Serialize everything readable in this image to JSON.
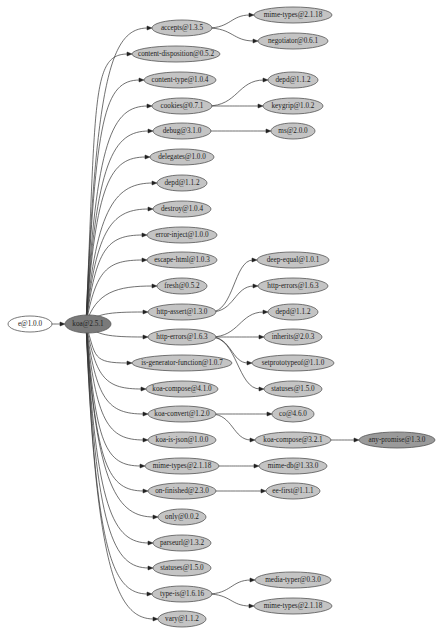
{
  "graph": {
    "title": "Dependency graph",
    "colors": {
      "root_fill": "#ffffff",
      "main_fill": "#7a7a7a",
      "dep_fill": "#c4c4c4",
      "deep_fill": "#9a9a9a",
      "stroke": "#555555",
      "edge": "#333333"
    },
    "nodes": [
      {
        "id": "e",
        "label": "e@1.0.0",
        "x": 30,
        "y": 324,
        "rx": 22,
        "ry": 8,
        "kind": "root"
      },
      {
        "id": "koa",
        "label": "koa@2.5.1",
        "x": 88,
        "y": 324,
        "rx": 23,
        "ry": 9,
        "kind": "main"
      },
      {
        "id": "accepts",
        "label": "accepts@1.3.5",
        "x": 182,
        "y": 28,
        "rx": 30,
        "ry": 8,
        "kind": "dep"
      },
      {
        "id": "content-disposition",
        "label": "content-disposition@0.5.2",
        "x": 176,
        "y": 54,
        "rx": 44,
        "ry": 8,
        "kind": "dep"
      },
      {
        "id": "content-type",
        "label": "content-type@1.0.4",
        "x": 180,
        "y": 80,
        "rx": 36,
        "ry": 8,
        "kind": "dep"
      },
      {
        "id": "cookies",
        "label": "cookies@0.7.1",
        "x": 182,
        "y": 106,
        "rx": 30,
        "ry": 8,
        "kind": "dep"
      },
      {
        "id": "debug",
        "label": "debug@3.1.0",
        "x": 182,
        "y": 131,
        "rx": 29,
        "ry": 8,
        "kind": "dep"
      },
      {
        "id": "delegates",
        "label": "delegates@1.0.0",
        "x": 182,
        "y": 157,
        "rx": 32,
        "ry": 8,
        "kind": "dep"
      },
      {
        "id": "depd",
        "label": "depd@1.1.2",
        "x": 182,
        "y": 183,
        "rx": 25,
        "ry": 8,
        "kind": "dep"
      },
      {
        "id": "destroy",
        "label": "destroy@1.0.4",
        "x": 182,
        "y": 209,
        "rx": 29,
        "ry": 8,
        "kind": "dep"
      },
      {
        "id": "error-inject",
        "label": "error-inject@1.0.0",
        "x": 182,
        "y": 235,
        "rx": 35,
        "ry": 8,
        "kind": "dep"
      },
      {
        "id": "escape-html",
        "label": "escape-html@1.0.3",
        "x": 182,
        "y": 260,
        "rx": 35,
        "ry": 8,
        "kind": "dep"
      },
      {
        "id": "fresh",
        "label": "fresh@0.5.2",
        "x": 182,
        "y": 286,
        "rx": 25,
        "ry": 8,
        "kind": "dep"
      },
      {
        "id": "http-assert",
        "label": "http-assert@1.3.0",
        "x": 182,
        "y": 312,
        "rx": 34,
        "ry": 8,
        "kind": "dep"
      },
      {
        "id": "http-errors",
        "label": "http-errors@1.6.3",
        "x": 182,
        "y": 337,
        "rx": 34,
        "ry": 8,
        "kind": "dep"
      },
      {
        "id": "is-generator-function",
        "label": "is-generator-function@1.0.7",
        "x": 182,
        "y": 363,
        "rx": 50,
        "ry": 8,
        "kind": "dep"
      },
      {
        "id": "koa-compose4",
        "label": "koa-compose@4.1.0",
        "x": 182,
        "y": 389,
        "rx": 36,
        "ry": 8,
        "kind": "dep"
      },
      {
        "id": "koa-convert",
        "label": "koa-convert@1.2.0",
        "x": 182,
        "y": 414,
        "rx": 34,
        "ry": 8,
        "kind": "dep"
      },
      {
        "id": "koa-is-json",
        "label": "koa-is-json@1.0.0",
        "x": 182,
        "y": 440,
        "rx": 34,
        "ry": 8,
        "kind": "dep"
      },
      {
        "id": "mime-types-a",
        "label": "mime-types@2.1.18",
        "x": 182,
        "y": 466,
        "rx": 37,
        "ry": 8,
        "kind": "dep"
      },
      {
        "id": "on-finished",
        "label": "on-finished@2.3.0",
        "x": 182,
        "y": 491,
        "rx": 34,
        "ry": 8,
        "kind": "dep"
      },
      {
        "id": "only",
        "label": "only@0.0.2",
        "x": 182,
        "y": 517,
        "rx": 24,
        "ry": 8,
        "kind": "dep"
      },
      {
        "id": "parseurl",
        "label": "parseurl@1.3.2",
        "x": 182,
        "y": 543,
        "rx": 29,
        "ry": 8,
        "kind": "dep"
      },
      {
        "id": "statuses-a",
        "label": "statuses@1.5.0",
        "x": 182,
        "y": 568,
        "rx": 29,
        "ry": 8,
        "kind": "dep"
      },
      {
        "id": "type-is",
        "label": "type-is@1.6.16",
        "x": 182,
        "y": 594,
        "rx": 30,
        "ry": 8,
        "kind": "dep"
      },
      {
        "id": "vary",
        "label": "vary@1.1.2",
        "x": 182,
        "y": 619,
        "rx": 24,
        "ry": 8,
        "kind": "dep"
      },
      {
        "id": "mime-types-b",
        "label": "mime-types@2.1.18",
        "x": 293,
        "y": 15,
        "rx": 39,
        "ry": 8,
        "kind": "dep"
      },
      {
        "id": "negotiator",
        "label": "negotiator@0.6.1",
        "x": 293,
        "y": 41,
        "rx": 35,
        "ry": 8,
        "kind": "dep"
      },
      {
        "id": "depd-b",
        "label": "depd@1.1.2",
        "x": 293,
        "y": 80,
        "rx": 25,
        "ry": 8,
        "kind": "dep"
      },
      {
        "id": "keygrip",
        "label": "keygrip@1.0.2",
        "x": 293,
        "y": 106,
        "rx": 30,
        "ry": 8,
        "kind": "dep"
      },
      {
        "id": "ms",
        "label": "ms@2.0.0",
        "x": 293,
        "y": 131,
        "rx": 22,
        "ry": 8,
        "kind": "dep"
      },
      {
        "id": "deep-equal",
        "label": "deep-equal@1.0.1",
        "x": 293,
        "y": 260,
        "rx": 36,
        "ry": 8,
        "kind": "dep"
      },
      {
        "id": "http-errors-b",
        "label": "http-errors@1.6.3",
        "x": 293,
        "y": 286,
        "rx": 35,
        "ry": 8,
        "kind": "dep"
      },
      {
        "id": "depd-c",
        "label": "depd@1.1.2",
        "x": 293,
        "y": 312,
        "rx": 25,
        "ry": 8,
        "kind": "dep"
      },
      {
        "id": "inherits",
        "label": "inherits@2.0.3",
        "x": 293,
        "y": 337,
        "rx": 29,
        "ry": 8,
        "kind": "dep"
      },
      {
        "id": "setprototypeof",
        "label": "setprototypeof@1.1.0",
        "x": 293,
        "y": 363,
        "rx": 41,
        "ry": 8,
        "kind": "dep"
      },
      {
        "id": "statuses-b",
        "label": "statuses@1.5.0",
        "x": 293,
        "y": 389,
        "rx": 29,
        "ry": 8,
        "kind": "dep"
      },
      {
        "id": "co",
        "label": "co@4.6.0",
        "x": 293,
        "y": 414,
        "rx": 21,
        "ry": 8,
        "kind": "dep"
      },
      {
        "id": "koa-compose3",
        "label": "koa-compose@3.2.1",
        "x": 293,
        "y": 440,
        "rx": 38,
        "ry": 8,
        "kind": "dep"
      },
      {
        "id": "mime-db",
        "label": "mime-db@1.33.0",
        "x": 293,
        "y": 466,
        "rx": 34,
        "ry": 8,
        "kind": "dep"
      },
      {
        "id": "ee-first",
        "label": "ee-first@1.1.1",
        "x": 293,
        "y": 491,
        "rx": 27,
        "ry": 8,
        "kind": "dep"
      },
      {
        "id": "media-typer",
        "label": "media-typer@0.3.0",
        "x": 293,
        "y": 580,
        "rx": 38,
        "ry": 8,
        "kind": "dep"
      },
      {
        "id": "mime-types-c",
        "label": "mime-types@2.1.18",
        "x": 293,
        "y": 606,
        "rx": 39,
        "ry": 8,
        "kind": "dep"
      },
      {
        "id": "any-promise",
        "label": "any-promise@1.3.0",
        "x": 397,
        "y": 440,
        "rx": 38,
        "ry": 8,
        "kind": "deep"
      }
    ],
    "edges": [
      [
        "e",
        "koa"
      ],
      [
        "koa",
        "accepts"
      ],
      [
        "koa",
        "content-disposition"
      ],
      [
        "koa",
        "content-type"
      ],
      [
        "koa",
        "cookies"
      ],
      [
        "koa",
        "debug"
      ],
      [
        "koa",
        "delegates"
      ],
      [
        "koa",
        "depd"
      ],
      [
        "koa",
        "destroy"
      ],
      [
        "koa",
        "error-inject"
      ],
      [
        "koa",
        "escape-html"
      ],
      [
        "koa",
        "fresh"
      ],
      [
        "koa",
        "http-assert"
      ],
      [
        "koa",
        "http-errors"
      ],
      [
        "koa",
        "is-generator-function"
      ],
      [
        "koa",
        "koa-compose4"
      ],
      [
        "koa",
        "koa-convert"
      ],
      [
        "koa",
        "koa-is-json"
      ],
      [
        "koa",
        "mime-types-a"
      ],
      [
        "koa",
        "on-finished"
      ],
      [
        "koa",
        "only"
      ],
      [
        "koa",
        "parseurl"
      ],
      [
        "koa",
        "statuses-a"
      ],
      [
        "koa",
        "type-is"
      ],
      [
        "koa",
        "vary"
      ],
      [
        "accepts",
        "mime-types-b"
      ],
      [
        "accepts",
        "negotiator"
      ],
      [
        "cookies",
        "depd-b"
      ],
      [
        "cookies",
        "keygrip"
      ],
      [
        "debug",
        "ms"
      ],
      [
        "http-assert",
        "deep-equal"
      ],
      [
        "http-assert",
        "http-errors-b"
      ],
      [
        "http-errors",
        "depd-c"
      ],
      [
        "http-errors",
        "inherits"
      ],
      [
        "http-errors",
        "setprototypeof"
      ],
      [
        "http-errors",
        "statuses-b"
      ],
      [
        "koa-convert",
        "co"
      ],
      [
        "koa-convert",
        "koa-compose3"
      ],
      [
        "koa-compose3",
        "any-promise"
      ],
      [
        "mime-types-a",
        "mime-db"
      ],
      [
        "on-finished",
        "ee-first"
      ],
      [
        "type-is",
        "media-typer"
      ],
      [
        "type-is",
        "mime-types-c"
      ]
    ]
  }
}
